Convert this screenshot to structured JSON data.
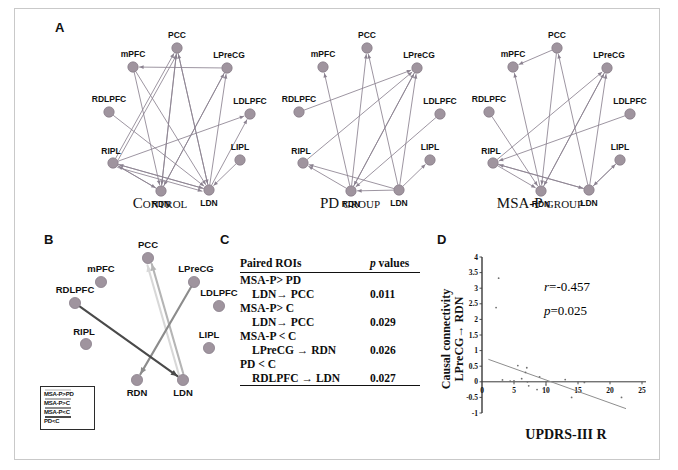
{
  "figure": {
    "panels": [
      {
        "letter": "A"
      },
      {
        "letter": "B"
      },
      {
        "letter": "C"
      },
      {
        "letter": "D"
      }
    ]
  },
  "colors": {
    "node_fill": "#9a8f99",
    "node_stroke": "#7e7380",
    "edge": "#8b8290",
    "msa_p_gt_pd": "#d8d8d8",
    "msa_p_gt_c": "#b5b5b5",
    "msa_p_lt_c": "#8c8c8c",
    "pd_lt_c": "#4a4a4a",
    "axis": "#3a3a3a",
    "fit_line": "#8e8e8e",
    "point": "#6f6f6f"
  },
  "networks": [
    {
      "id": "control",
      "title": "Control",
      "nodes": [
        {
          "name": "PCC",
          "x": 132,
          "y": 38
        },
        {
          "name": "mPFC",
          "x": 88,
          "y": 57
        },
        {
          "name": "LPreCG",
          "x": 182,
          "y": 58
        },
        {
          "name": "RDLPFC",
          "x": 64,
          "y": 102
        },
        {
          "name": "LDLPFC",
          "x": 205,
          "y": 104
        },
        {
          "name": "RIPL",
          "x": 68,
          "y": 153
        },
        {
          "name": "LIPL",
          "x": 195,
          "y": 150
        },
        {
          "name": "RDN",
          "x": 116,
          "y": 181
        },
        {
          "name": "LDN",
          "x": 164,
          "y": 180
        }
      ],
      "edges": [
        {
          "from": "LPreCG",
          "to": "mPFC"
        },
        {
          "from": "RDN",
          "to": "PCC"
        },
        {
          "from": "LDN",
          "to": "PCC"
        },
        {
          "from": "RIPL",
          "to": "PCC"
        },
        {
          "from": "RIPL",
          "to": "PCC",
          "offset": 3
        },
        {
          "from": "PCC",
          "to": "RDN"
        },
        {
          "from": "PCC",
          "to": "LDN"
        },
        {
          "from": "mPFC",
          "to": "RDN"
        },
        {
          "from": "mPFC",
          "to": "LDN"
        },
        {
          "from": "LDN",
          "to": "LPreCG"
        },
        {
          "from": "RDN",
          "to": "LPreCG"
        },
        {
          "from": "LPreCG",
          "to": "RDN"
        },
        {
          "from": "RDLPFC",
          "to": "LDN"
        },
        {
          "from": "RIPL",
          "to": "LDLPFC"
        },
        {
          "from": "RIPL",
          "to": "RDN"
        },
        {
          "from": "RIPL",
          "to": "LDN"
        },
        {
          "from": "RIPL",
          "to": "LDN",
          "offset": 3
        },
        {
          "from": "LDN",
          "to": "RIPL"
        },
        {
          "from": "RDN",
          "to": "RIPL"
        },
        {
          "from": "LIPL",
          "to": "LDN"
        },
        {
          "from": "LDN",
          "to": "LDLPFC"
        }
      ]
    },
    {
      "id": "pd",
      "title": "PD group",
      "nodes": [
        {
          "name": "PCC",
          "x": 132,
          "y": 38
        },
        {
          "name": "mPFC",
          "x": 88,
          "y": 57
        },
        {
          "name": "LPreCG",
          "x": 182,
          "y": 58
        },
        {
          "name": "RDLPFC",
          "x": 64,
          "y": 102
        },
        {
          "name": "LDLPFC",
          "x": 205,
          "y": 104
        },
        {
          "name": "RIPL",
          "x": 68,
          "y": 153
        },
        {
          "name": "LIPL",
          "x": 195,
          "y": 150
        },
        {
          "name": "RDN",
          "x": 116,
          "y": 181
        },
        {
          "name": "LDN",
          "x": 164,
          "y": 180
        }
      ],
      "edges": [
        {
          "from": "LDN",
          "to": "PCC"
        },
        {
          "from": "RDN",
          "to": "PCC"
        },
        {
          "from": "RDN",
          "to": "mPFC"
        },
        {
          "from": "RDLPFC",
          "to": "LPreCG"
        },
        {
          "from": "RIPL",
          "to": "LPreCG"
        },
        {
          "from": "LDN",
          "to": "LPreCG"
        },
        {
          "from": "RDN",
          "to": "LPreCG"
        },
        {
          "from": "LPreCG",
          "to": "RDN"
        },
        {
          "from": "LDLPFC",
          "to": "RDN"
        },
        {
          "from": "LDN",
          "to": "RIPL"
        },
        {
          "from": "RDN",
          "to": "RIPL"
        },
        {
          "from": "LDN",
          "to": "LIPL"
        },
        {
          "from": "LDN",
          "to": "RDN"
        }
      ]
    },
    {
      "id": "msap",
      "title": "MSA-P group",
      "nodes": [
        {
          "name": "PCC",
          "x": 132,
          "y": 38
        },
        {
          "name": "mPFC",
          "x": 88,
          "y": 57
        },
        {
          "name": "LPreCG",
          "x": 182,
          "y": 58
        },
        {
          "name": "RDLPFC",
          "x": 64,
          "y": 102
        },
        {
          "name": "LDLPFC",
          "x": 205,
          "y": 104
        },
        {
          "name": "RIPL",
          "x": 68,
          "y": 153
        },
        {
          "name": "LIPL",
          "x": 195,
          "y": 150
        },
        {
          "name": "RDN",
          "x": 116,
          "y": 181
        },
        {
          "name": "LDN",
          "x": 164,
          "y": 180
        }
      ],
      "edges": [
        {
          "from": "PCC",
          "to": "mPFC"
        },
        {
          "from": "RDN",
          "to": "mPFC"
        },
        {
          "from": "LDN",
          "to": "PCC"
        },
        {
          "from": "RDN",
          "to": "LPreCG"
        },
        {
          "from": "LDN",
          "to": "LPreCG"
        },
        {
          "from": "RIPL",
          "to": "LPreCG"
        },
        {
          "from": "LPreCG",
          "to": "RDN"
        },
        {
          "from": "RDLPFC",
          "to": "RDN"
        },
        {
          "from": "RIPL",
          "to": "RDN"
        },
        {
          "from": "RIPL",
          "to": "LDN"
        },
        {
          "from": "LDN",
          "to": "RIPL"
        },
        {
          "from": "LDLPFC",
          "to": "RIPL"
        },
        {
          "from": "LIPL",
          "to": "LDN"
        },
        {
          "from": "LDN",
          "to": "LIPL"
        },
        {
          "from": "PCC",
          "to": "RDN"
        }
      ]
    }
  ],
  "panelB": {
    "nodes": [
      {
        "name": "PCC",
        "x": 100,
        "y": 18
      },
      {
        "name": "mPFC",
        "x": 53,
        "y": 42
      },
      {
        "name": "LPreCG",
        "x": 146,
        "y": 42
      },
      {
        "name": "RDLPFC",
        "x": 27,
        "y": 63
      },
      {
        "name": "LDLPFC",
        "x": 171,
        "y": 66
      },
      {
        "name": "RIPL",
        "x": 38,
        "y": 104
      },
      {
        "name": "LIPL",
        "x": 161,
        "y": 108
      },
      {
        "name": "RDN",
        "x": 89,
        "y": 140
      },
      {
        "name": "LDN",
        "x": 135,
        "y": 140
      }
    ],
    "edges": [
      {
        "from": "LDN",
        "to": "PCC",
        "style": "msa_p_gt_pd",
        "offset": -2.5
      },
      {
        "from": "LDN",
        "to": "PCC",
        "style": "msa_p_gt_c",
        "offset": 2.0
      },
      {
        "from": "LPreCG",
        "to": "RDN",
        "style": "msa_p_lt_c"
      },
      {
        "from": "RDLPFC",
        "to": "LDN",
        "style": "pd_lt_c"
      }
    ],
    "legend": [
      {
        "label": "MSA-P>PD",
        "style": "msa_p_gt_pd"
      },
      {
        "label": "MSA-P>C",
        "style": "msa_p_gt_c"
      },
      {
        "label": "MSA-P<C",
        "style": "msa_p_lt_c"
      },
      {
        "label": "PD<C",
        "style": "pd_lt_c"
      }
    ]
  },
  "panelC": {
    "headers": {
      "roi": "Paired ROIs",
      "p": "p values"
    },
    "rows": [
      {
        "type": "group",
        "label": "MSA-P> PD"
      },
      {
        "type": "pair",
        "label": "LDN→ PCC",
        "p": "0.011"
      },
      {
        "type": "group",
        "label": "MSA-P> C"
      },
      {
        "type": "pair",
        "label": "LDN→ PCC",
        "p": "0.029"
      },
      {
        "type": "group",
        "label": "MSA-P < C"
      },
      {
        "type": "pair",
        "label": "LPreCG → RDN",
        "p": "0.026"
      },
      {
        "type": "group",
        "label": "PD < C"
      },
      {
        "type": "pair",
        "label": "RDLPFC → LDN",
        "p": "0.027"
      }
    ]
  },
  "chart_data": {
    "type": "scatter",
    "title": "",
    "xlabel": "UPDRS-III R",
    "ylabel": "Causal connectivity LPreCG→ RDN",
    "ylabel_line1": "Causal connectivity",
    "ylabel_line2": "LPreCG→ RDN",
    "xlim": [
      0,
      25
    ],
    "ylim": [
      -1,
      4
    ],
    "xticks": [
      0,
      5,
      10,
      15,
      20,
      25
    ],
    "xticklabels": [
      "0",
      "5",
      "10",
      "15",
      "20",
      "25"
    ],
    "yticks": [
      -1,
      -0.5,
      0,
      0.5,
      1,
      1.5,
      2,
      2.5,
      3,
      3.5,
      4
    ],
    "yticklabels": [
      "-1",
      "-0.5",
      "0",
      "0.5",
      "1",
      "1.5",
      "2",
      "2.5",
      "3",
      "3.5",
      "4"
    ],
    "grid": false,
    "annotations": [
      {
        "text": "r=-0.457",
        "stat": "r",
        "value": "-0.457"
      },
      {
        "text": "p=0.025",
        "stat": "p",
        "value": "0.025"
      }
    ],
    "points": [
      {
        "x": 2.6,
        "y": 3.32
      },
      {
        "x": 2.2,
        "y": 2.38
      },
      {
        "x": 3.2,
        "y": 0.06
      },
      {
        "x": 4.4,
        "y": 0.02
      },
      {
        "x": 5.0,
        "y": 0.03
      },
      {
        "x": 5.6,
        "y": 0.52
      },
      {
        "x": 6.2,
        "y": 0.1
      },
      {
        "x": 6.8,
        "y": 0.3
      },
      {
        "x": 7.0,
        "y": 0.45
      },
      {
        "x": 7.1,
        "y": 0.0
      },
      {
        "x": 7.3,
        "y": -0.13
      },
      {
        "x": 8.6,
        "y": -0.25
      },
      {
        "x": 9.0,
        "y": 0.16
      },
      {
        "x": 9.6,
        "y": -0.22
      },
      {
        "x": 10.0,
        "y": -0.1
      },
      {
        "x": 10.2,
        "y": -0.3
      },
      {
        "x": 13.0,
        "y": 0.07
      },
      {
        "x": 14.0,
        "y": -0.5
      },
      {
        "x": 16.0,
        "y": -0.02
      },
      {
        "x": 21.8,
        "y": -0.5
      }
    ],
    "fit_line": {
      "x0": 1.0,
      "y0": 0.72,
      "x1": 22.5,
      "y1": -0.86,
      "r": -0.457,
      "p": 0.025
    }
  }
}
